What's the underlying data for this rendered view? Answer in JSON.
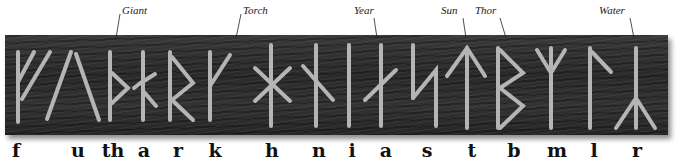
{
  "labels": [
    {
      "text": "Giant",
      "x": 122,
      "line": [
        120,
        14,
        116,
        38
      ]
    },
    {
      "text": "Torch",
      "x": 243,
      "line": [
        241,
        14,
        236,
        38
      ]
    },
    {
      "text": "Year",
      "x": 354,
      "line": [
        374,
        18,
        377,
        38
      ]
    },
    {
      "text": "Sun",
      "x": 441,
      "line": [
        463,
        18,
        466,
        38
      ]
    },
    {
      "text": "Thor",
      "x": 475,
      "line": [
        500,
        18,
        506,
        38
      ]
    },
    {
      "text": "Water",
      "x": 599,
      "line": [
        630,
        18,
        634,
        38
      ]
    }
  ],
  "runes": [
    {
      "name": "fehu",
      "letter": "f",
      "x": 18
    },
    {
      "name": "uruz",
      "letter": "u",
      "x": 75
    },
    {
      "name": "thurisaz",
      "letter": "th",
      "x": 112
    },
    {
      "name": "ansuz",
      "letter": "a",
      "x": 143
    },
    {
      "name": "raido",
      "letter": "r",
      "x": 172
    },
    {
      "name": "kaun",
      "letter": "k",
      "x": 210
    },
    {
      "name": "hagall",
      "letter": "h",
      "x": 270
    },
    {
      "name": "naud",
      "letter": "n",
      "x": 316
    },
    {
      "name": "isa",
      "letter": "i",
      "x": 349
    },
    {
      "name": "ar",
      "letter": "a",
      "x": 381
    },
    {
      "name": "sol",
      "letter": "s",
      "x": 420
    },
    {
      "name": "tyr",
      "letter": "t",
      "x": 466
    },
    {
      "name": "bjarkan",
      "letter": "b",
      "x": 498
    },
    {
      "name": "madr",
      "letter": "m",
      "x": 551
    },
    {
      "name": "logr",
      "letter": "l",
      "x": 590
    },
    {
      "name": "yr",
      "letter": "r",
      "x": 636
    }
  ],
  "transliteration": [
    {
      "text": "f",
      "x": 16
    },
    {
      "text": "u",
      "x": 78
    },
    {
      "text": "th",
      "x": 113
    },
    {
      "text": "a",
      "x": 144
    },
    {
      "text": "r",
      "x": 178
    },
    {
      "text": "k",
      "x": 215
    },
    {
      "text": "h",
      "x": 272
    },
    {
      "text": "n",
      "x": 319
    },
    {
      "text": "i",
      "x": 352
    },
    {
      "text": "a",
      "x": 386
    },
    {
      "text": "s",
      "x": 427
    },
    {
      "text": "t",
      "x": 472
    },
    {
      "text": "b",
      "x": 514
    },
    {
      "text": "m",
      "x": 557
    },
    {
      "text": "l",
      "x": 594
    },
    {
      "text": "r",
      "x": 637
    }
  ],
  "colors": {
    "slab": "#2e2e2e",
    "carving": "#b8b8b8",
    "text": "#111111"
  }
}
